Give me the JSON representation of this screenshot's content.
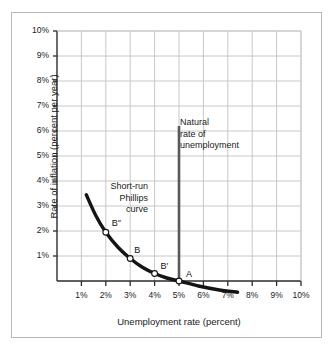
{
  "chart_data": {
    "type": "line",
    "title": "",
    "xlabel": "Unemployment rate (percent)",
    "ylabel": "Rate of inflation (percent per year)",
    "xlim": [
      0,
      10
    ],
    "ylim": [
      0,
      10
    ],
    "grid": true,
    "legend": "none",
    "x_ticks": [
      "1%",
      "2%",
      "3%",
      "4%",
      "5%",
      "6%",
      "7%",
      "8%",
      "9%",
      "10%"
    ],
    "x_tick_values": [
      1,
      2,
      3,
      4,
      5,
      6,
      7,
      8,
      9,
      10
    ],
    "y_ticks": [
      "1%",
      "2%",
      "3%",
      "4%",
      "5%",
      "6%",
      "7%",
      "8%",
      "9%",
      "10%"
    ],
    "y_tick_values": [
      1,
      2,
      3,
      4,
      5,
      6,
      7,
      8,
      9,
      10
    ],
    "series": [
      {
        "name": "Short-run Phillips curve",
        "type": "curve",
        "color": "#141414",
        "points": [
          {
            "x": 1.2,
            "y": 3.45
          },
          {
            "x": 1.6,
            "y": 2.6
          },
          {
            "x": 2.0,
            "y": 1.95
          },
          {
            "x": 2.5,
            "y": 1.35
          },
          {
            "x": 3.0,
            "y": 0.9
          },
          {
            "x": 3.5,
            "y": 0.55
          },
          {
            "x": 4.0,
            "y": 0.3
          },
          {
            "x": 4.5,
            "y": 0.12
          },
          {
            "x": 5.0,
            "y": 0.0
          },
          {
            "x": 5.8,
            "y": -0.2
          },
          {
            "x": 6.6,
            "y": -0.35
          },
          {
            "x": 7.4,
            "y": -0.45
          }
        ]
      },
      {
        "name": "Natural rate of unemployment",
        "type": "vertical-line",
        "color": "#595959",
        "x": 5.0,
        "y_from": 0.0,
        "y_to": 6.2
      }
    ],
    "markers": [
      {
        "label": "B″",
        "x": 2.0,
        "y": 1.95
      },
      {
        "label": "B",
        "x": 3.0,
        "y": 0.9
      },
      {
        "label": "B′",
        "x": 4.0,
        "y": 0.3
      },
      {
        "label": "A",
        "x": 5.0,
        "y": 0.0
      }
    ],
    "annotations": [
      {
        "name": "short-run-phillips-curve-label",
        "lines": [
          "Short-run",
          "Phillips",
          "curve"
        ]
      },
      {
        "name": "natural-rate-label",
        "lines": [
          "Natural",
          "rate of",
          "unemployment"
        ]
      }
    ],
    "colors": {
      "curve": "#141414",
      "natural_rate_line": "#595959",
      "grid": "#c8c8c8",
      "axis": "#2b2b2b",
      "frame": "#b9b9b9",
      "marker_fill": "#ffffff",
      "background": "#ffffff"
    }
  }
}
